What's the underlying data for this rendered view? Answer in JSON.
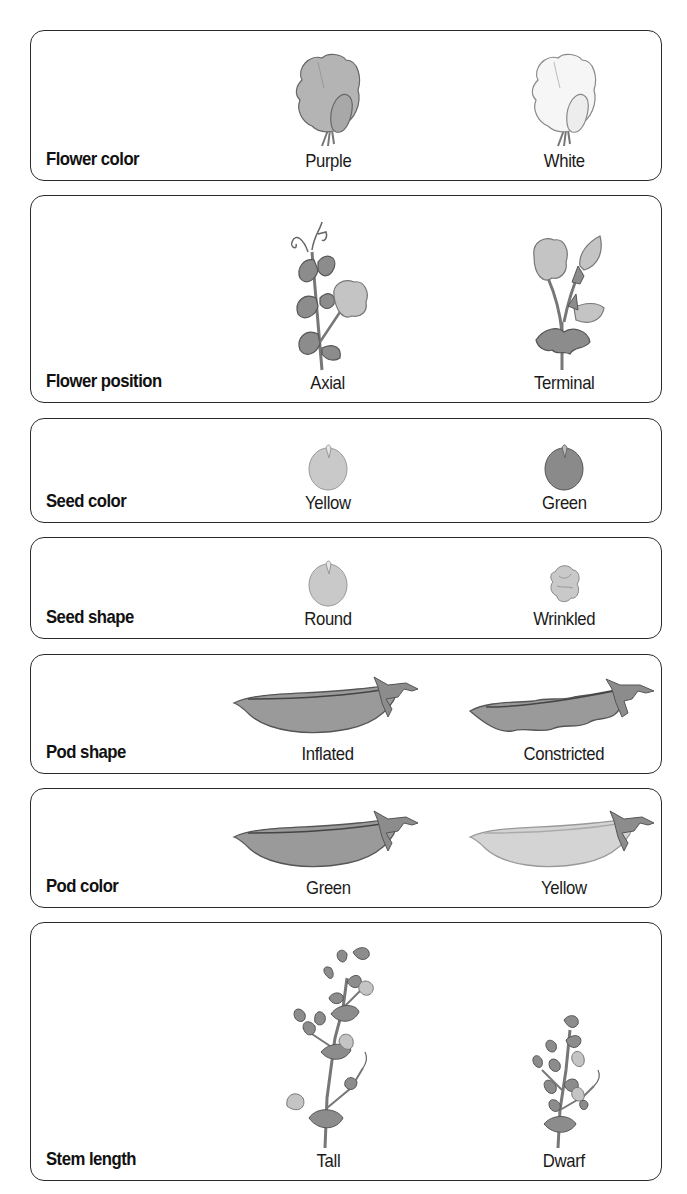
{
  "traits": [
    {
      "label": "Flower color",
      "variants": [
        {
          "label": "Purple",
          "icon": "purple-flower-icon",
          "fill": "#b4b4b4"
        },
        {
          "label": "White",
          "icon": "white-flower-icon",
          "fill": "#f6f6f6"
        }
      ]
    },
    {
      "label": "Flower position",
      "variants": [
        {
          "label": "Axial",
          "icon": "axial-flower-plant-icon"
        },
        {
          "label": "Terminal",
          "icon": "terminal-flower-plant-icon"
        }
      ]
    },
    {
      "label": "Seed color",
      "variants": [
        {
          "label": "Yellow",
          "icon": "yellow-seed-icon",
          "fill": "#c9c9c9"
        },
        {
          "label": "Green",
          "icon": "green-seed-icon",
          "fill": "#8a8a8a"
        }
      ]
    },
    {
      "label": "Seed shape",
      "variants": [
        {
          "label": "Round",
          "icon": "round-seed-icon"
        },
        {
          "label": "Wrinkled",
          "icon": "wrinkled-seed-icon"
        }
      ]
    },
    {
      "label": "Pod shape",
      "variants": [
        {
          "label": "Inflated",
          "icon": "inflated-pod-icon"
        },
        {
          "label": "Constricted",
          "icon": "constricted-pod-icon"
        }
      ]
    },
    {
      "label": "Pod color",
      "variants": [
        {
          "label": "Green",
          "icon": "green-pod-icon",
          "fill": "#9a9a9a"
        },
        {
          "label": "Yellow",
          "icon": "yellow-pod-icon",
          "fill": "#d4d4d4"
        }
      ]
    },
    {
      "label": "Stem length",
      "variants": [
        {
          "label": "Tall",
          "icon": "tall-plant-icon"
        },
        {
          "label": "Dwarf",
          "icon": "dwarf-plant-icon"
        }
      ]
    }
  ],
  "colors": {
    "border": "#2a2a2a",
    "leaf": "#8c8c8c",
    "leaf_stroke": "#555555",
    "petal": "#c4c4c4",
    "pod_green": "#9a9a9a",
    "pod_yellow": "#d4d4d4",
    "seed_yellow": "#c9c9c9",
    "seed_green": "#8a8a8a"
  }
}
